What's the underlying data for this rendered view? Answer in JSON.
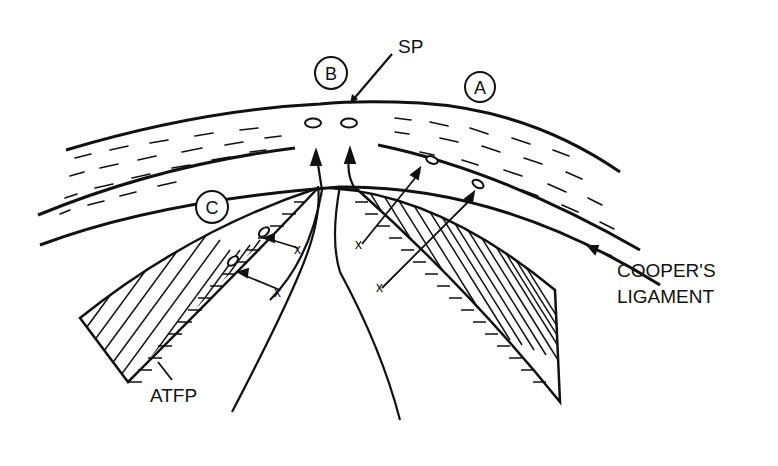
{
  "diagram": {
    "type": "anatomical-line-drawing",
    "labels": {
      "sp": "SP",
      "a": "A",
      "b": "B",
      "c": "C",
      "coopers_1": "COOPER'S",
      "coopers_2": "LIGAMENT",
      "atfp": "ATFP",
      "x1": "x",
      "x2": "x",
      "x3": "x",
      "x4": "x"
    },
    "colors": {
      "ink": "#111111",
      "background": "#ffffff"
    }
  }
}
